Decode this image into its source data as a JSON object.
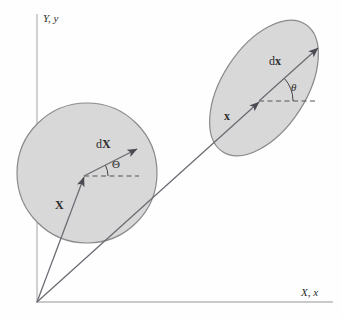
{
  "figure": {
    "name": "deformation-kinematics-diagram",
    "background": "#fefefe",
    "width": 342,
    "height": 319
  },
  "colors": {
    "body_fill": "#d8d8d8",
    "body_stroke": "#8a8a8a",
    "vector_stroke": "#4a4a52",
    "axis_stroke": "#b8b8b8",
    "dashed_stroke": "#555555",
    "text": "#2b2b2b"
  },
  "axes": {
    "vertical": {
      "label": "Y, y",
      "x": 37,
      "y_top": 14,
      "y_bottom": 302
    },
    "horizontal": {
      "label": "X, x",
      "y": 302,
      "x_left": 37,
      "x_right": 333
    },
    "origin": {
      "x": 37,
      "y": 302
    }
  },
  "bodies": [
    {
      "id": "reference-configuration",
      "shape": "circle",
      "cx": 87,
      "cy": 173,
      "r": 70,
      "rotation": 0
    },
    {
      "id": "current-configuration",
      "shape": "ellipse",
      "cx": 264,
      "cy": 88,
      "rx": 42,
      "ry": 76,
      "rotation": 33
    }
  ],
  "vectors": [
    {
      "id": "position-vector-reference",
      "label": "X",
      "label_x": 57,
      "label_y": 207,
      "from": {
        "x": 37,
        "y": 302
      },
      "to": {
        "x": 84,
        "y": 176
      }
    },
    {
      "id": "differential-vector-reference",
      "label": "dX",
      "label_prefix": "d",
      "label_bold": "X",
      "label_x": 99,
      "label_y": 146,
      "from": {
        "x": 84,
        "y": 176
      },
      "to": {
        "x": 139,
        "y": 148
      }
    },
    {
      "id": "position-vector-current",
      "label": "x",
      "label_x": 226,
      "label_y": 117,
      "from": {
        "x": 37,
        "y": 302
      },
      "to": {
        "x": 259,
        "y": 101
      }
    },
    {
      "id": "differential-vector-current",
      "label": "dx",
      "label_prefix": "d",
      "label_bold": "x",
      "label_x": 272,
      "label_y": 63,
      "from": {
        "x": 259,
        "y": 101
      },
      "to": {
        "x": 320,
        "y": 46
      }
    }
  ],
  "angles": [
    {
      "id": "angle-theta-reference",
      "label": "Θ",
      "label_x": 115,
      "label_y": 166,
      "vertex": {
        "x": 84,
        "y": 176
      },
      "dashed_to": {
        "x": 139,
        "y": 176
      },
      "arc_radius": 24,
      "degrees": 27
    },
    {
      "id": "angle-theta-current",
      "label": "θ",
      "label_x": 295,
      "label_y": 89,
      "vertex": {
        "x": 259,
        "y": 101
      },
      "dashed_to": {
        "x": 316,
        "y": 101
      },
      "arc_radius": 34,
      "degrees": 42
    }
  ]
}
